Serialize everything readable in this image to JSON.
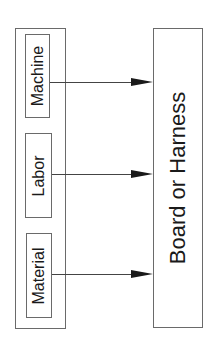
{
  "diagram": {
    "inputs_group": {
      "items": [
        {
          "label": "Machine"
        },
        {
          "label": "Labor"
        },
        {
          "label": "Material"
        }
      ]
    },
    "output": {
      "label": "Board or Harness"
    },
    "arrows": [
      {
        "from": "Machine",
        "to": "Board or Harness"
      },
      {
        "from": "Labor",
        "to": "Board or Harness"
      },
      {
        "from": "Material",
        "to": "Board or Harness"
      }
    ],
    "colors": {
      "stroke": "#6a6a6a",
      "arrowhead": "#1a1a1a",
      "text": "#1a1a1a"
    }
  }
}
